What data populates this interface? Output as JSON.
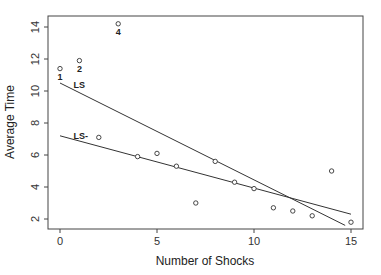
{
  "chart_data": {
    "type": "scatter",
    "title": "",
    "xlabel": "Number of Shocks",
    "ylabel": "Average Time",
    "xlim": [
      -0.6,
      15.6
    ],
    "ylim": [
      1.6,
      14.6
    ],
    "x_ticks": [
      0,
      5,
      10,
      15
    ],
    "y_ticks": [
      2,
      4,
      6,
      8,
      10,
      12,
      14
    ],
    "grid": false,
    "points": [
      {
        "x": 0,
        "y": 11.4,
        "label": "1"
      },
      {
        "x": 1,
        "y": 11.9,
        "label": "2"
      },
      {
        "x": 2,
        "y": 7.1,
        "label": ""
      },
      {
        "x": 3,
        "y": 14.2,
        "label": "4"
      },
      {
        "x": 4,
        "y": 5.9,
        "label": ""
      },
      {
        "x": 5,
        "y": 6.1,
        "label": ""
      },
      {
        "x": 6,
        "y": 5.3,
        "label": ""
      },
      {
        "x": 7,
        "y": 3.0,
        "label": ""
      },
      {
        "x": 8,
        "y": 5.6,
        "label": ""
      },
      {
        "x": 9,
        "y": 4.3,
        "label": ""
      },
      {
        "x": 10,
        "y": 3.9,
        "label": ""
      },
      {
        "x": 11,
        "y": 2.7,
        "label": ""
      },
      {
        "x": 12,
        "y": 2.5,
        "label": ""
      },
      {
        "x": 13,
        "y": 2.2,
        "label": ""
      },
      {
        "x": 14,
        "y": 5.0,
        "label": ""
      },
      {
        "x": 15,
        "y": 1.8,
        "label": ""
      }
    ],
    "lines": [
      {
        "name": "LS",
        "x0": 0,
        "y0": 10.5,
        "x1": 14.7,
        "y1": 1.6,
        "label_x": 0.7,
        "label_y": 10.4
      },
      {
        "name": "LS-",
        "x0": 0,
        "y0": 7.2,
        "x1": 15,
        "y1": 2.3,
        "label_x": 0.7,
        "label_y": 7.2
      }
    ]
  }
}
